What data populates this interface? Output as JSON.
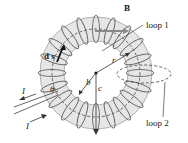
{
  "diagram": {
    "labels": {
      "B": "B",
      "ds": "d s",
      "loop1": "loop 1",
      "loop2": "loop 2",
      "r": "r",
      "b": "b",
      "c": "c",
      "theta": "θ",
      "I_top": "I",
      "I_bottom": "I"
    },
    "colors": {
      "core_fill": "#e6e6e6",
      "wire": "#555555",
      "outline": "#333333",
      "vector": "#111111",
      "b_arrow": "#888888"
    }
  }
}
